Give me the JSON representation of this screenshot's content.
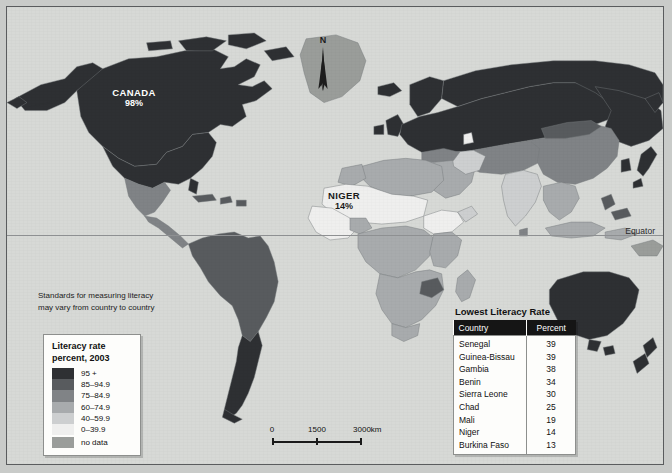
{
  "map": {
    "title": "World Literacy Rate Map",
    "equator_label": "Equator",
    "north_label": "N",
    "background_color": "#d7d9d6",
    "note": "Standards for measuring literacy may vary from country to country",
    "callouts": [
      {
        "id": "canada",
        "name": "CANADA",
        "value": "98%"
      },
      {
        "id": "niger",
        "name": "NIGER",
        "value": "14%"
      }
    ]
  },
  "legend": {
    "title_line1": "Literacy rate",
    "title_line2": "percent, 2003",
    "entries": [
      {
        "label": "95 +",
        "color": "#2e3033"
      },
      {
        "label": "85–94.9",
        "color": "#585b5e"
      },
      {
        "label": "75–84.9",
        "color": "#808386"
      },
      {
        "label": "60–74.9",
        "color": "#a8abad"
      },
      {
        "label": "40–59.9",
        "color": "#cdcfd0"
      },
      {
        "label": "0–39.9",
        "color": "#efefee"
      },
      {
        "label": "no data",
        "color": "#9a9d9a"
      }
    ]
  },
  "scale": {
    "ticks": [
      "0",
      "1500",
      "3000"
    ],
    "unit": "km"
  },
  "table": {
    "title": "Lowest Literacy Rate",
    "columns": [
      "Country",
      "Percent"
    ],
    "rows": [
      {
        "country": "Senegal",
        "percent": "39"
      },
      {
        "country": "Guinea-Bissau",
        "percent": "39"
      },
      {
        "country": "Gambia",
        "percent": "38"
      },
      {
        "country": "Benin",
        "percent": "34"
      },
      {
        "country": "Sierra Leone",
        "percent": "30"
      },
      {
        "country": "Chad",
        "percent": "25"
      },
      {
        "country": "Mali",
        "percent": "19"
      },
      {
        "country": "Niger",
        "percent": "14"
      },
      {
        "country": "Burkina Faso",
        "percent": "13"
      }
    ]
  }
}
